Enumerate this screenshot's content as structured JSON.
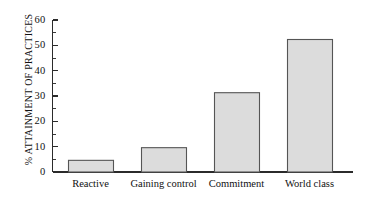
{
  "chart_data": {
    "type": "bar",
    "title": "",
    "subtitle": "",
    "xlabel": "",
    "ylabel": "% ATTAINMENT OF PRACTICES",
    "categories": [
      "Reactive",
      "Gaining control",
      "Commitment",
      "World class"
    ],
    "values": [
      4.8,
      9.8,
      31.5,
      52.5
    ],
    "series": [
      {
        "name": "% Attainment of practices",
        "values": [
          4.8,
          9.8,
          31.5,
          52.5
        ]
      }
    ],
    "ylim": [
      0,
      60
    ],
    "ytick_labels": [
      "0",
      "10",
      "20",
      "30",
      "40",
      "50",
      "60"
    ],
    "ytick_values": [
      0,
      10,
      20,
      30,
      40,
      50,
      60
    ],
    "yminor_values": [
      5,
      15,
      25,
      35,
      45,
      55
    ],
    "grid": false,
    "legend": false,
    "legend_position": "none",
    "bar_fill_color": "#dcdcdc",
    "bar_edge_color": "#555555",
    "axis_color": "#2b2b2b",
    "background_color": "#ffffff"
  }
}
